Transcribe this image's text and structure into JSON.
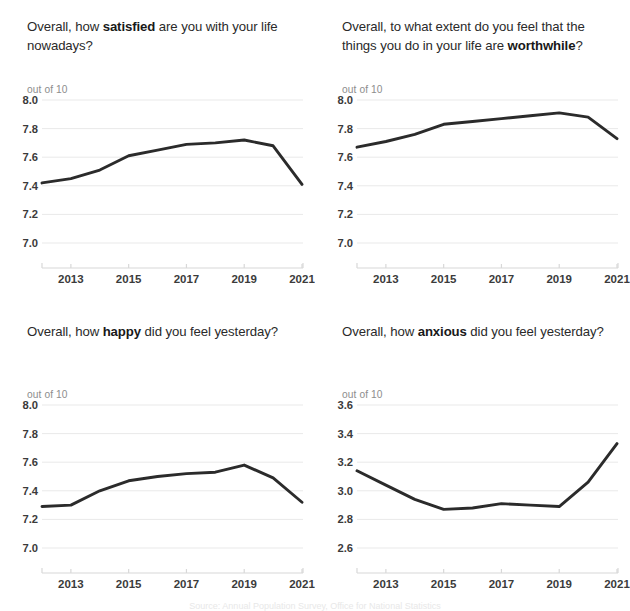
{
  "page": {
    "units_label": "out of 10",
    "footnote": "Source: Annual Population Survey, Office for National Statistics"
  },
  "panels": [
    {
      "id": "satisfied",
      "title_pre": "Overall, how ",
      "title_bold": "satisfied",
      "title_post": " are you with your life nowadays?",
      "units": "out of 10"
    },
    {
      "id": "worthwhile",
      "title_pre": "Overall, to what extent do you feel that the things you do in your life are ",
      "title_bold": "worthwhile",
      "title_post": "?",
      "units": "out of 10"
    },
    {
      "id": "happy",
      "title_pre": "Overall, how ",
      "title_bold": "happy",
      "title_post": " did you feel yesterday?",
      "units": "out of 10"
    },
    {
      "id": "anxious",
      "title_pre": "Overall, how ",
      "title_bold": "anxious",
      "title_post": " did you feel yesterday?",
      "units": "out of 10"
    }
  ],
  "chart_data": [
    {
      "type": "line",
      "id": "satisfied",
      "title": "Overall, how satisfied are you with your life nowadays?",
      "xlabel": "",
      "ylabel": "out of 10",
      "x": [
        2012,
        2013,
        2014,
        2015,
        2016,
        2017,
        2018,
        2019,
        2020,
        2021
      ],
      "values": [
        7.42,
        7.45,
        7.51,
        7.61,
        7.65,
        7.69,
        7.7,
        7.72,
        7.68,
        7.41
      ],
      "xticks": [
        "2013",
        "2015",
        "2017",
        "2019",
        "2021"
      ],
      "xtick_values": [
        2013,
        2015,
        2017,
        2019,
        2021
      ],
      "yticks": [
        "7.0",
        "7.2",
        "7.4",
        "7.6",
        "7.8",
        "8.0"
      ],
      "ytick_values": [
        7.0,
        7.2,
        7.4,
        7.6,
        7.8,
        8.0
      ],
      "ylim": [
        6.9,
        8.05
      ],
      "xlim": [
        2012,
        2021
      ],
      "grid": true,
      "legend": "none",
      "line_color": "#2b2b2b"
    },
    {
      "type": "line",
      "id": "worthwhile",
      "title": "Overall, to what extent do you feel that the things you do in your life are worthwhile?",
      "xlabel": "",
      "ylabel": "out of 10",
      "x": [
        2012,
        2013,
        2014,
        2015,
        2016,
        2017,
        2018,
        2019,
        2020,
        2021
      ],
      "values": [
        7.67,
        7.71,
        7.76,
        7.83,
        7.85,
        7.87,
        7.89,
        7.91,
        7.88,
        7.73
      ],
      "xticks": [
        "2013",
        "2015",
        "2017",
        "2019",
        "2021"
      ],
      "xtick_values": [
        2013,
        2015,
        2017,
        2019,
        2021
      ],
      "yticks": [
        "7.0",
        "7.2",
        "7.4",
        "7.6",
        "7.8",
        "8.0"
      ],
      "ytick_values": [
        7.0,
        7.2,
        7.4,
        7.6,
        7.8,
        8.0
      ],
      "ylim": [
        6.9,
        8.05
      ],
      "xlim": [
        2012,
        2021
      ],
      "grid": true,
      "legend": "none",
      "line_color": "#2b2b2b"
    },
    {
      "type": "line",
      "id": "happy",
      "title": "Overall, how happy did you feel yesterday?",
      "xlabel": "",
      "ylabel": "out of 10",
      "x": [
        2012,
        2013,
        2014,
        2015,
        2016,
        2017,
        2018,
        2019,
        2020,
        2021
      ],
      "values": [
        7.29,
        7.3,
        7.4,
        7.47,
        7.5,
        7.52,
        7.53,
        7.58,
        7.49,
        7.32
      ],
      "xticks": [
        "2013",
        "2015",
        "2017",
        "2019",
        "2021"
      ],
      "xtick_values": [
        2013,
        2015,
        2017,
        2019,
        2021
      ],
      "yticks": [
        "7.0",
        "7.2",
        "7.4",
        "7.6",
        "7.8",
        "8.0"
      ],
      "ytick_values": [
        7.0,
        7.2,
        7.4,
        7.6,
        7.8,
        8.0
      ],
      "ylim": [
        6.9,
        8.05
      ],
      "xlim": [
        2012,
        2021
      ],
      "grid": true,
      "legend": "none",
      "line_color": "#2b2b2b"
    },
    {
      "type": "line",
      "id": "anxious",
      "title": "Overall, how anxious did you feel yesterday?",
      "xlabel": "",
      "ylabel": "out of 10",
      "x": [
        2012,
        2013,
        2014,
        2015,
        2016,
        2017,
        2018,
        2019,
        2020,
        2021
      ],
      "values": [
        3.14,
        3.04,
        2.94,
        2.87,
        2.88,
        2.91,
        2.9,
        2.89,
        3.06,
        3.33
      ],
      "xticks": [
        "2013",
        "2015",
        "2017",
        "2019",
        "2021"
      ],
      "xtick_values": [
        2013,
        2015,
        2017,
        2019,
        2021
      ],
      "yticks": [
        "2.6",
        "2.8",
        "3.0",
        "3.2",
        "3.4",
        "3.6"
      ],
      "ytick_values": [
        2.6,
        2.8,
        3.0,
        3.2,
        3.4,
        3.6
      ],
      "ylim": [
        2.5,
        3.65
      ],
      "xlim": [
        2012,
        2021
      ],
      "grid": true,
      "legend": "none",
      "line_color": "#2b2b2b"
    }
  ]
}
